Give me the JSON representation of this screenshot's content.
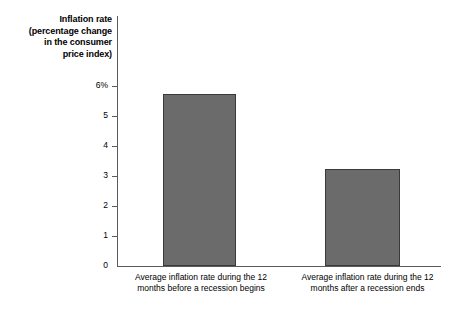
{
  "chart_data": {
    "type": "bar",
    "title": "",
    "ylabel": "Inflation rate (percentage change in the consumer price index)",
    "ylabel_lines": "Inflation rate\n(percentage change\nin the consumer\nprice index)",
    "xlabel": "",
    "categories": [
      "Average inflation rate during the 12\nmonths before a recession begins",
      "Average inflation rate during the 12\nmonths after a recession ends"
    ],
    "values": [
      5.75,
      3.25
    ],
    "ylim": [
      0,
      6
    ],
    "yticks": [
      0,
      1,
      2,
      3,
      4,
      5,
      6
    ],
    "ytick_labels": [
      "0",
      "1",
      "2",
      "3",
      "4",
      "5",
      "6%"
    ],
    "grid": false,
    "legend": "none",
    "bar_color": "#6b6b6b",
    "bar_edge_color": "#3a3a3a",
    "axis_color": "#5b5b5b",
    "background": "#ffffff"
  }
}
